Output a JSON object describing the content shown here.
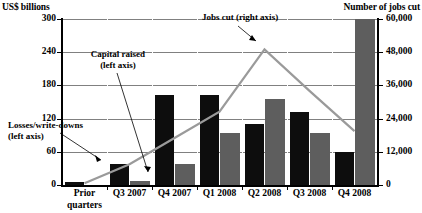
{
  "chart_data": {
    "type": "bar",
    "title": "",
    "categories": [
      "Prior\nquarters",
      "Q3 2007",
      "Q4 2007",
      "Q1 2008",
      "Q2 2008",
      "Q3 2008",
      "Q4 2008"
    ],
    "category_labels": [
      {
        "line1": "Prior",
        "line2": "quarters"
      },
      {
        "line1": "Q3 2007",
        "line2": ""
      },
      {
        "line1": "Q4 2007",
        "line2": ""
      },
      {
        "line1": "Q1 2008",
        "line2": ""
      },
      {
        "line1": "Q2 2008",
        "line2": ""
      },
      {
        "line1": "Q3 2008",
        "line2": ""
      },
      {
        "line1": "Q4 2008",
        "line2": ""
      }
    ],
    "series": [
      {
        "name": "Losses/write-downs (left axis)",
        "axis": "left",
        "type": "bar",
        "color": "#0d0d0d",
        "values": [
          6,
          38,
          163,
          163,
          110,
          132,
          60
        ]
      },
      {
        "name": "Capital raised (left axis)",
        "axis": "left",
        "type": "bar",
        "color": "#5e5e5e",
        "values": [
          0,
          8,
          38,
          94,
          156,
          94,
          300
        ]
      },
      {
        "name": "Jobs cut (right axis)",
        "axis": "right",
        "type": "line",
        "color": "#9a9a9a",
        "values": [
          600,
          7500,
          17000,
          26500,
          49000,
          34000,
          19500
        ]
      }
    ],
    "ylabel_left": "US$ billions",
    "ylabel_right": "Number of jobs cut",
    "yticks_left": [
      "300",
      "240",
      "180",
      "120",
      "60",
      "0"
    ],
    "yticks_right": [
      "60,000",
      "48,000",
      "36,000",
      "24,000",
      "12,000",
      "0"
    ],
    "ylim_left": [
      0,
      300
    ],
    "ylim_right": [
      0,
      60000
    ],
    "xlabel": "",
    "grid": true,
    "legend": "annotations-with-leader-lines",
    "annotations": [
      {
        "id": "losses",
        "line1": "Losses/write-downs",
        "line2": "(left axis)"
      },
      {
        "id": "capital",
        "line1": "Capital raised",
        "line2": "(left axis)"
      },
      {
        "id": "jobs",
        "line1": "Jobs cut (right axis)",
        "line2": ""
      }
    ]
  },
  "axes": {
    "left_title": "US$ billions",
    "right_title": "Number of jobs cut"
  },
  "annotations": {
    "losses_l1": "Losses/write-downs",
    "losses_l2": "(left axis)",
    "capital_l1": "Capital raised",
    "capital_l2": "(left axis)",
    "jobs_l1": "Jobs cut (right axis)"
  }
}
